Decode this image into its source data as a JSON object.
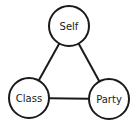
{
  "diagram": {
    "type": "triangle-relationship",
    "colors": {
      "stroke": "#1a1a1a",
      "fill": "#ffffff"
    },
    "nodes": [
      {
        "id": "self",
        "label": "Self",
        "cx": 69,
        "cy": 26,
        "r": 20
      },
      {
        "id": "class",
        "label": "Class",
        "cx": 29,
        "cy": 98,
        "r": 20
      },
      {
        "id": "party",
        "label": "Party",
        "cx": 109,
        "cy": 99,
        "r": 20
      }
    ],
    "edges": [
      {
        "from": "self",
        "to": "class"
      },
      {
        "from": "self",
        "to": "party"
      },
      {
        "from": "class",
        "to": "party"
      }
    ]
  }
}
